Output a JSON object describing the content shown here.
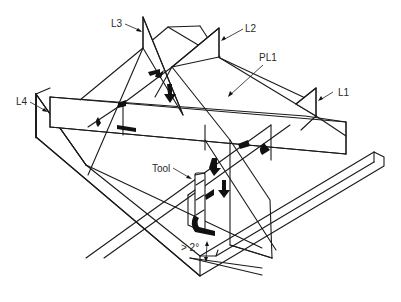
{
  "diagram": {
    "labels": {
      "l1": "L1",
      "l2": "L2",
      "l3": "L3",
      "l4": "L4",
      "pl1": "PL1",
      "tool": "Tool",
      "angle": "> 2°"
    },
    "colors": {
      "line": "#1a1a1a",
      "background": "#ffffff",
      "arrow": "#111111"
    }
  }
}
